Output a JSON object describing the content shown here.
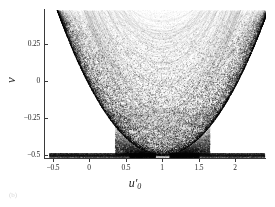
{
  "figure": {
    "caption": "(b)"
  },
  "chart_data": {
    "type": "scatter",
    "title": "",
    "xlabel": "u'0",
    "xlabel_base": "u",
    "xlabel_prime": "′",
    "xlabel_sub": "0",
    "ylabel": "v",
    "xlim": [
      -0.62,
      2.42
    ],
    "ylim": [
      -0.52,
      0.48
    ],
    "xticks": [
      -0.5,
      0,
      0.5,
      1,
      1.5,
      2
    ],
    "xticklabels": [
      "−0.5",
      "0",
      "0.5",
      "1",
      "1.5",
      "2"
    ],
    "yticks": [
      0.25,
      0,
      -0.25,
      -0.5
    ],
    "yticklabels": [
      "0.25",
      "0",
      "−0.25",
      "−0.5"
    ],
    "grid": false,
    "legend": null,
    "marker": "point",
    "marker_color": "#000000",
    "point_size": 0.6,
    "symmetry_axis": 1.0,
    "envelope": {
      "form": "v = a*(u-1)^2 + c",
      "a": 0.47,
      "c": -0.5,
      "vertex": [
        1.0,
        -0.5
      ]
    },
    "features": [
      {
        "name": "dense-baseline",
        "y": -0.5,
        "x_range": [
          -0.55,
          2.4
        ]
      },
      {
        "name": "darkest-baseline-left",
        "x_range": [
          0.55,
          0.95
        ],
        "y": -0.5
      },
      {
        "name": "darkest-baseline-right",
        "x_range": [
          1.05,
          1.5
        ],
        "y": -0.5
      },
      {
        "name": "lacuna-left",
        "center": [
          -0.04,
          -0.3
        ],
        "rx": 0.16,
        "ry": 0.1
      },
      {
        "name": "lacuna-right",
        "center": [
          2.04,
          -0.3
        ],
        "rx": 0.16,
        "ry": 0.1
      },
      {
        "name": "empty-core",
        "description": "white region inside parabola above vertex"
      }
    ],
    "n_points": 42000,
    "x": [],
    "y": []
  },
  "axes": {
    "spine_color": "#3a3a3a",
    "tick_color": "#3a3a3a",
    "label_color": "#2a2a2a"
  }
}
